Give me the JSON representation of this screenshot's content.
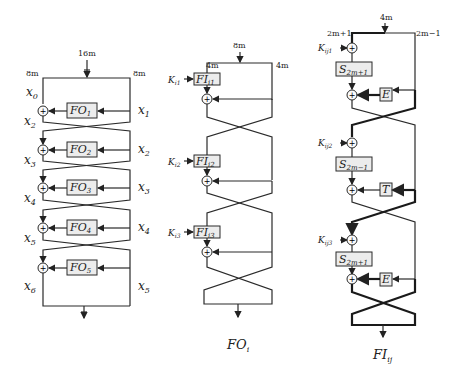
{
  "fo": {
    "input_width": "16m",
    "left_width": "8m",
    "right_width": "8m",
    "x0": "x",
    "x0_sub": "0",
    "left_vars": [
      {
        "v": "x",
        "s": "2"
      },
      {
        "v": "x",
        "s": "3"
      },
      {
        "v": "x",
        "s": "4"
      },
      {
        "v": "x",
        "s": "5"
      },
      {
        "v": "x",
        "s": "6"
      }
    ],
    "right_vars": [
      {
        "v": "x",
        "s": "1"
      },
      {
        "v": "x",
        "s": "2"
      },
      {
        "v": "x",
        "s": "3"
      },
      {
        "v": "x",
        "s": "4"
      },
      {
        "v": "x",
        "s": "5"
      }
    ],
    "boxes": [
      {
        "v": "FO",
        "s": "1"
      },
      {
        "v": "FO",
        "s": "2"
      },
      {
        "v": "FO",
        "s": "3"
      },
      {
        "v": "FO",
        "s": "4"
      },
      {
        "v": "FO",
        "s": "5"
      }
    ]
  },
  "fo_i": {
    "input_width": "8m",
    "left_width": "4m",
    "right_width": "4m",
    "keys": [
      {
        "v": "K",
        "s": "i1"
      },
      {
        "v": "K",
        "s": "i2"
      },
      {
        "v": "K",
        "s": "i3"
      }
    ],
    "boxes": [
      {
        "v": "FI",
        "s": "i1"
      },
      {
        "v": "FI",
        "s": "i2"
      },
      {
        "v": "FI",
        "s": "i3"
      }
    ],
    "caption": {
      "v": "FO",
      "s": "i"
    }
  },
  "fi_ij": {
    "input_width": "4m",
    "left_width": "2m+1",
    "right_width": "2m−1",
    "keys": [
      {
        "v": "K",
        "s": "ij1"
      },
      {
        "v": "K",
        "s": "ij2"
      },
      {
        "v": "K",
        "s": "ij3"
      }
    ],
    "s_boxes": [
      {
        "v": "S",
        "s": "2m+1"
      },
      {
        "v": "S",
        "s": "2m−1"
      },
      {
        "v": "S",
        "s": "2m+1"
      }
    ],
    "func_boxes": [
      "E",
      "T",
      "E"
    ],
    "caption": {
      "v": "FI",
      "s": "ij"
    }
  }
}
